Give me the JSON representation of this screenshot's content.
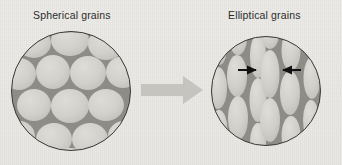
{
  "figure": {
    "type": "diagram",
    "background_color": "#eceae6",
    "panels": [
      {
        "id": "left-panel",
        "caption": "Spherical grains",
        "shape": "circle",
        "circle": {
          "cx": 71,
          "cy": 91,
          "r": 60
        },
        "grain_shape": "spherical",
        "grain_fill": "#d2d0cb",
        "grain_boundary_color": "#8d8c86",
        "outline_color": "#3a3a38",
        "grain_count": 15
      },
      {
        "id": "right-panel",
        "caption": "Elliptical grains",
        "shape": "circle",
        "circle": {
          "cx": 266,
          "cy": 91,
          "r": 55
        },
        "grain_shape": "elliptical",
        "grain_fill": "#d2d0cb",
        "grain_boundary_color": "#8d8c86",
        "outline_color": "#3a3a38",
        "grain_count": 18,
        "elongation_axis": "vertical",
        "annotation_arrows": [
          {
            "direction": "right",
            "x_start": 238,
            "x_end": 258,
            "y": 70,
            "color": "#111111"
          },
          {
            "direction": "left",
            "x_start": 301,
            "x_end": 280,
            "y": 70,
            "color": "#111111"
          }
        ]
      }
    ],
    "transition_arrow": {
      "direction": "right",
      "x_start": 141,
      "x_end": 203,
      "y": 90,
      "color": "#c6c4bf"
    }
  }
}
